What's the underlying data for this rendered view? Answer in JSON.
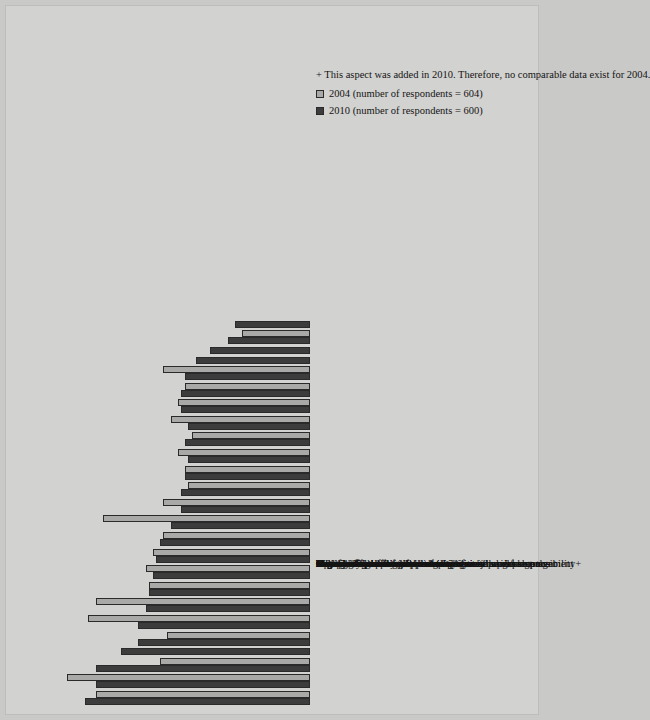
{
  "chart_data": {
    "type": "bar",
    "title": "",
    "xlabel": "",
    "ylabel": "",
    "ylim": [
      0,
      80
    ],
    "grid": false,
    "orientation": "rotated-90",
    "tick_labels": [
      "0%",
      "10%",
      "20%",
      "30%",
      "40%",
      "50%",
      "60%",
      "70%",
      "80%"
    ],
    "tick_values": [
      0,
      10,
      20,
      30,
      40,
      50,
      60,
      70,
      80
    ],
    "legend_position": "bottom",
    "categories": [
      "Job security",
      "Benefits",
      "Opportunities to use skills and abilities",
      "Organization's financial stability+",
      "The work itself",
      "Compensation/pay",
      "Feeling safe in the work environment",
      "Relationship with immediate supervisor",
      "Management recognition of employee job performance",
      "Communication between employees and senior management",
      "Autonomy and independence",
      "Flexible to balance life and work issues",
      "Overall corporate culture",
      "Meaningfulness of job",
      "Relationships with co-workers",
      "Contributions of work to organization's business goals",
      "Variety of work",
      "Job-specific training",
      "Career advancement opportunities",
      "Organization's commitment to professional development",
      "Career development opportunities",
      "Organization's commitment to corporate social responsibility+",
      "Paid training and tuition reimbursement programs+",
      "Networking",
      "Organization's commitment to a “green” workplace+"
    ],
    "series": [
      {
        "name": "2010 (number of respondents = 600)",
        "color": "#3c3c3c",
        "values": [
          63,
          60,
          60,
          53,
          48,
          48,
          46,
          45,
          44,
          43,
          42,
          39,
          36,
          36,
          35,
          34,
          35,
          34,
          36,
          36,
          35,
          32,
          28,
          23,
          21
        ]
      },
      {
        "name": "2004 (number of respondents = 604)",
        "color": "#a9a9a7",
        "values": [
          60,
          68,
          42,
          null,
          40,
          62,
          60,
          45,
          46,
          44,
          41,
          58,
          41,
          34,
          35,
          37,
          33,
          39,
          37,
          35,
          41,
          null,
          null,
          19,
          null
        ]
      }
    ],
    "legend": [
      {
        "label": "2010 (number of respondents = 600)",
        "color": "#3c3c3c"
      },
      {
        "label": "2004 (number of respondents = 604)",
        "color": "#a9a9a7"
      }
    ],
    "footnote": "+ This aspect was added in 2010. Therefore, no comparable data exist for 2004."
  }
}
